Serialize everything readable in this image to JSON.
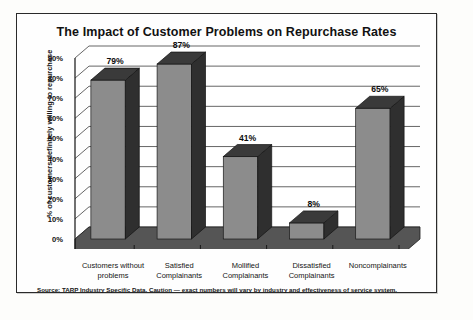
{
  "chart_data": {
    "type": "bar",
    "title": "The Impact of Customer Problems on Repurchase Rates",
    "xlabel": "",
    "ylabel": "% of customers definitely willing to repurchase",
    "categories": [
      "Customers without problems",
      "Satisfied Complainants",
      "Mollified Complainants",
      "Dissatisfied Complainants",
      "Noncomplainants"
    ],
    "category_lines": [
      [
        "Customers without",
        "problems"
      ],
      [
        "Satisfied",
        "Complainants"
      ],
      [
        "Mollified",
        "Complainants"
      ],
      [
        "Dissatisfied",
        "Complainants"
      ],
      [
        "Noncomplainants",
        ""
      ]
    ],
    "values": [
      79,
      87,
      41,
      8,
      65
    ],
    "value_labels": [
      "79%",
      "87%",
      "41%",
      "8%",
      "65%"
    ],
    "ylim": [
      0,
      90
    ],
    "ytick_values": [
      0,
      10,
      20,
      30,
      40,
      50,
      60,
      70,
      80,
      90
    ],
    "ytick_labels": [
      "0%",
      "10%",
      "20%",
      "30%",
      "40%",
      "50%",
      "60%",
      "70%",
      "80%",
      "90%"
    ],
    "grid": true,
    "legend": "none",
    "style": "3d-column",
    "colors": {
      "bar_front": "#8c8c8c",
      "bar_side": "#2f2f2f",
      "bar_top": "#3a3a3a",
      "floor": "#555555",
      "gridline": "#555555",
      "axis": "#111111",
      "frame": "#2a2a2a",
      "background": "#fefefe",
      "text": "#111111"
    }
  },
  "source": {
    "note": "Source:  TARP Industry Specific Data. Caution — exact numbers will vary by industry and effectiveness of service system."
  }
}
